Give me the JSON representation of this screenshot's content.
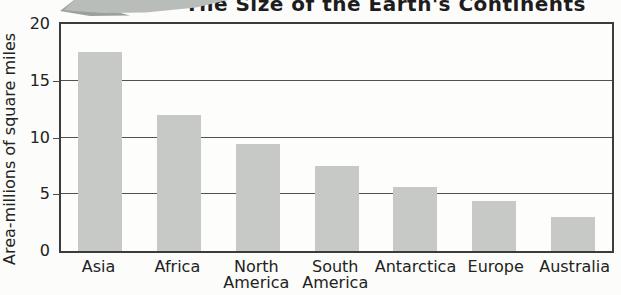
{
  "title": "The Size of the Earth's Continents",
  "chart_data": {
    "type": "bar",
    "title": "The Size of the Earth's Continents",
    "categories": [
      "Asia",
      "Africa",
      "North America",
      "South America",
      "Antarctica",
      "Europe",
      "Australia"
    ],
    "values": [
      17.5,
      12,
      9.4,
      7.5,
      5.6,
      4.4,
      3.0
    ],
    "xlabel": "",
    "ylabel": "Area-millions of square miles",
    "ylim": [
      0,
      20
    ],
    "yticks": [
      0,
      5,
      10,
      15,
      20
    ],
    "ytick_labels": [
      "0",
      "5",
      "10",
      "15",
      "20"
    ],
    "grid": true,
    "legend": false,
    "bar_color": "#c7c9c6",
    "units": "millions of square miles"
  },
  "colors": {
    "bar_fill": "#c7c9c6",
    "plot_border": "#3c3c3c",
    "gridline": "#515151",
    "text": "#222222",
    "title_text": "#1d1d1d",
    "decoration_light": "#b9bdb9",
    "decoration_dark": "#9aa19b",
    "background": "#fcfcfb"
  },
  "decoration": {
    "name": "banner-swoosh-graphic"
  }
}
